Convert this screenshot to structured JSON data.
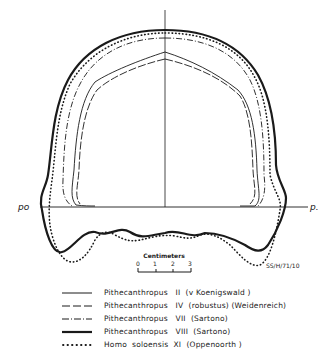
{
  "diagram": {
    "labels": {
      "left_point": "po",
      "right_point": "p.",
      "code": "SS/H/71/10"
    },
    "scale_bar": {
      "title": "Centimeters",
      "ticks": [
        "0",
        "1",
        "2",
        "3"
      ]
    },
    "legend": [
      {
        "style": "thin-solid",
        "text": "Pithecanthropus   II  (v Koenigswald )"
      },
      {
        "style": "dashed",
        "text": "Pithecanthropus   IV  (robustus) (Weidenreich)"
      },
      {
        "style": "dash-dot",
        "text": "Pithecanthropus   VII  (Sartono)"
      },
      {
        "style": "thick-solid",
        "text": "Pithecanthropus   VIII  (Sartono)"
      },
      {
        "style": "dotted",
        "text": "Homo  soloensis  XI  (Oppenoorth )"
      }
    ],
    "colors": {
      "ink": "#1a1a1a",
      "background": "#ffffff"
    }
  }
}
